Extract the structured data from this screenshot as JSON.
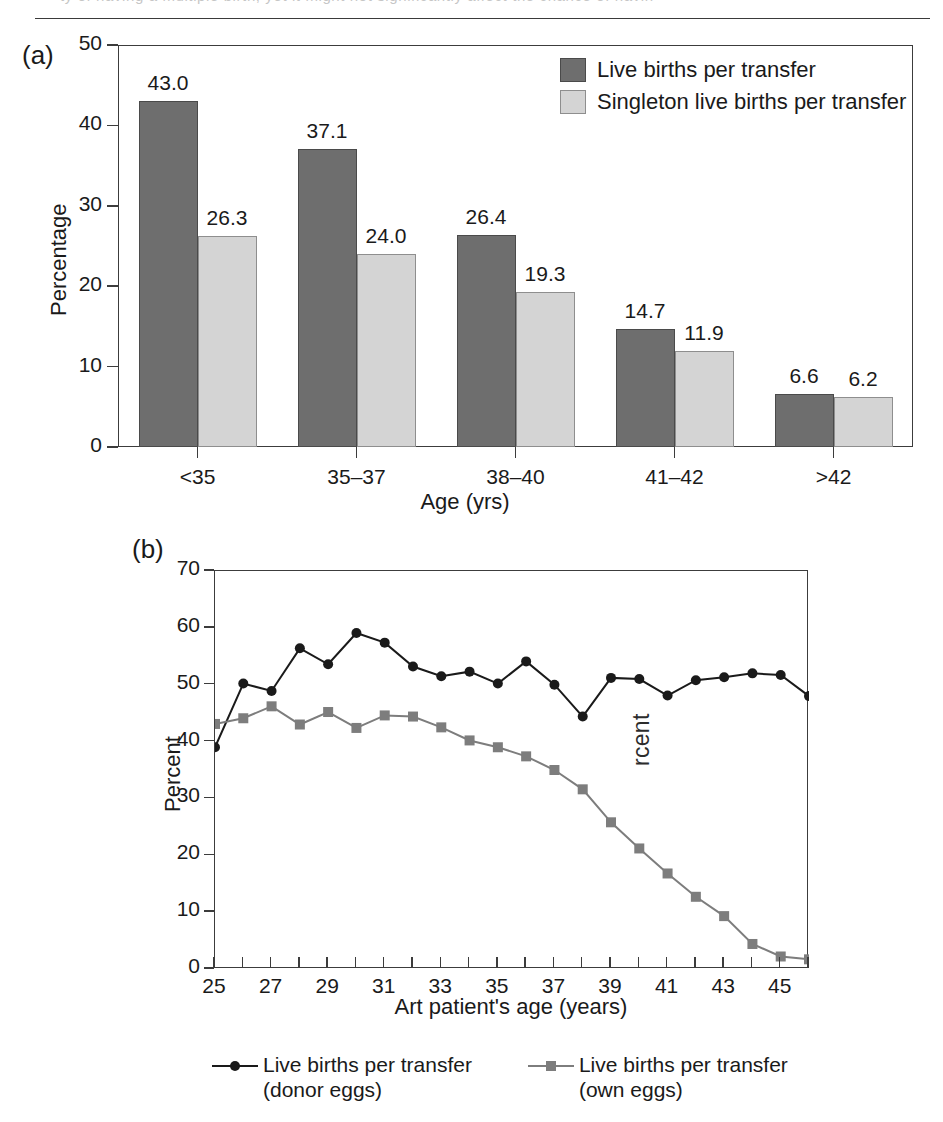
{
  "figure": {
    "page_top_bleed_text": "ty of having a multiple birth, yet it might not significantly affect the chance of havin",
    "ghost_text": "rcent"
  },
  "panel_a": {
    "label": "(a)",
    "ylabel": "Percentage",
    "xlabel": "Age (yrs)",
    "legend": [
      {
        "name": "live-births-per-transfer",
        "label": "Live births per transfer",
        "color": "#6e6e6e"
      },
      {
        "name": "singleton-live-births-per-transfer",
        "label": "Singleton live births per transfer",
        "color": "#d4d4d4"
      }
    ],
    "chart_data": {
      "type": "bar",
      "title": "",
      "xlabel": "Age (yrs)",
      "ylabel": "Percentage",
      "ylim": [
        0,
        50
      ],
      "yticks": [
        0,
        10,
        20,
        30,
        40,
        50
      ],
      "grid": false,
      "legend_position": "top-right",
      "categories": [
        "<35",
        "35–37",
        "38–40",
        "41–42",
        ">42"
      ],
      "series": [
        {
          "name": "Live births per transfer",
          "color": "#6e6e6e",
          "values": [
            43.0,
            37.1,
            26.4,
            14.7,
            6.6
          ]
        },
        {
          "name": "Singleton live births per transfer",
          "color": "#d4d4d4",
          "values": [
            26.3,
            24.0,
            19.3,
            11.9,
            6.2
          ]
        }
      ],
      "data_labels": [
        "43.0",
        "26.3",
        "37.1",
        "24.0",
        "26.4",
        "19.3",
        "14.7",
        "11.9",
        "6.6",
        "6.2"
      ]
    }
  },
  "panel_b": {
    "label": "(b)",
    "ylabel": "Percent",
    "xlabel": "Art patient's age (years)",
    "legend": [
      {
        "name": "donor-eggs",
        "label_line1": "Live births per transfer",
        "label_line2": "(donor eggs)",
        "color": "#1a1a1a",
        "marker": "circle"
      },
      {
        "name": "own-eggs",
        "label_line1": "Live births per transfer",
        "label_line2": "(own eggs)",
        "color": "#7d7d7d",
        "marker": "square"
      }
    ],
    "chart_data": {
      "type": "line",
      "title": "",
      "xlabel": "Art patient's age (years)",
      "ylabel": "Percent",
      "ylim": [
        0,
        70
      ],
      "yticks": [
        0,
        10,
        20,
        30,
        40,
        50,
        60,
        70
      ],
      "xlim": [
        25,
        46
      ],
      "xticks": [
        25,
        26,
        27,
        28,
        29,
        30,
        31,
        32,
        33,
        34,
        35,
        36,
        37,
        38,
        39,
        40,
        41,
        42,
        43,
        44,
        45,
        46
      ],
      "xtick_labels": [
        "25",
        "",
        "27",
        "",
        "29",
        "",
        "31",
        "",
        "33",
        "",
        "35",
        "",
        "37",
        "",
        "39",
        "",
        "41",
        "",
        "43",
        "",
        "45",
        ""
      ],
      "grid": false,
      "legend_position": "below",
      "x": [
        25,
        26,
        27,
        28,
        29,
        30,
        31,
        32,
        33,
        34,
        35,
        36,
        37,
        38,
        39,
        40,
        41,
        42,
        43,
        44,
        45,
        46
      ],
      "series": [
        {
          "name": "Live births per transfer (donor eggs)",
          "color": "#1a1a1a",
          "marker": "circle",
          "values": [
            39.0,
            50.2,
            48.9,
            56.4,
            53.6,
            59.1,
            57.4,
            53.2,
            51.5,
            52.3,
            50.2,
            54.1,
            50.0,
            44.4,
            51.2,
            51.0,
            48.1,
            50.8,
            51.3,
            52.0,
            51.7,
            48.0
          ]
        },
        {
          "name": "Live births per transfer (own eggs)",
          "color": "#7d7d7d",
          "marker": "square",
          "values": [
            43.1,
            44.1,
            46.2,
            43.0,
            45.2,
            42.4,
            44.6,
            44.4,
            42.5,
            40.2,
            39.0,
            37.4,
            35.0,
            31.6,
            25.8,
            21.2,
            16.8,
            12.7,
            9.3,
            4.4,
            2.2,
            1.7
          ]
        }
      ]
    }
  }
}
